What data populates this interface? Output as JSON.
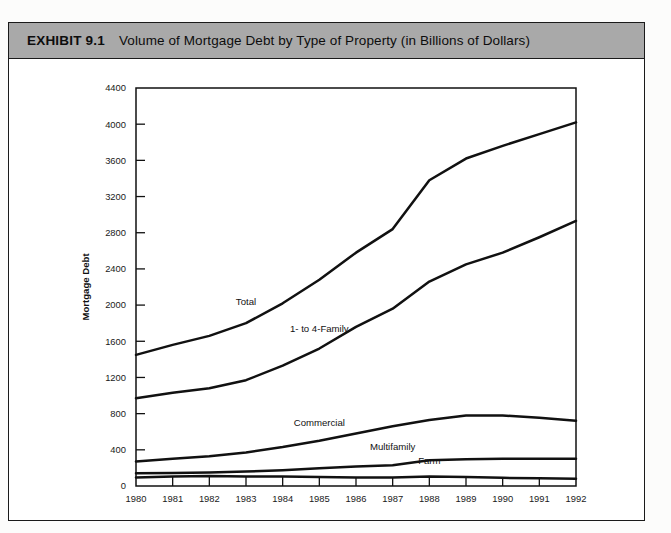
{
  "exhibit": {
    "number": "EXHIBIT 9.1",
    "title": "Volume of Mortgage Debt by Type of Property (in Billions of Dollars)"
  },
  "chart_data": {
    "type": "line",
    "title": "Volume of Mortgage Debt by Type of Property (in Billions of Dollars)",
    "xlabel": "Year",
    "ylabel": "Mortgage Debt",
    "categories": [
      1980,
      1981,
      1982,
      1983,
      1984,
      1985,
      1986,
      1987,
      1988,
      1989,
      1990,
      1991,
      1992
    ],
    "xticklabels": [
      "1980",
      "1981",
      "1982",
      "1983",
      "1984",
      "1985",
      "1986",
      "1987",
      "1988",
      "1989",
      "1990",
      "1991",
      "1992"
    ],
    "yticklabels": [
      "0",
      "400",
      "800",
      "1200",
      "1600",
      "2000",
      "2400",
      "2800",
      "3200",
      "3600",
      "4000",
      "4400"
    ],
    "ylim": [
      0,
      4400
    ],
    "xlim": [
      1980,
      1992
    ],
    "ytick_step": 400,
    "grid": false,
    "legend": "inline-labels",
    "series": [
      {
        "name": "Total",
        "values": [
          1450,
          1560,
          1660,
          1800,
          2020,
          2280,
          2580,
          2840,
          3380,
          3620,
          3760,
          3890,
          4020
        ]
      },
      {
        "name": "1- to 4-Family",
        "values": [
          970,
          1030,
          1080,
          1170,
          1330,
          1520,
          1760,
          1960,
          2260,
          2450,
          2580,
          2750,
          2930
        ]
      },
      {
        "name": "Commercial",
        "values": [
          270,
          300,
          330,
          370,
          430,
          500,
          580,
          660,
          730,
          780,
          780,
          755,
          720
        ]
      },
      {
        "name": "Multifamily",
        "values": [
          140,
          145,
          150,
          160,
          175,
          195,
          215,
          230,
          285,
          295,
          300,
          300,
          300
        ]
      },
      {
        "name": "Farm",
        "values": [
          95,
          105,
          110,
          105,
          105,
          100,
          95,
          95,
          105,
          100,
          90,
          85,
          80
        ]
      }
    ],
    "annotations": [
      {
        "text": "Total",
        "near_year": 1983,
        "near_value": 2000
      },
      {
        "text": "1- to 4-Family",
        "near_year": 1985,
        "near_value": 1700
      },
      {
        "text": "Commercial",
        "near_year": 1985,
        "near_value": 660
      },
      {
        "text": "Multifamily",
        "near_year": 1987,
        "near_value": 400
      },
      {
        "text": "Farm",
        "near_year": 1988,
        "near_value": 245
      }
    ]
  },
  "colors": {
    "header_band": "#a9a9a9",
    "line": "#111111",
    "card_border": "#1a1a1a",
    "page_background": "#fcfcfb"
  }
}
